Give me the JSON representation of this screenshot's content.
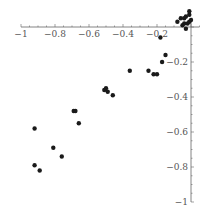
{
  "chart_data": {
    "type": "scatter",
    "title": "",
    "xlabel": "",
    "ylabel": "",
    "xlim": [
      -1,
      0.05
    ],
    "ylim": [
      -1,
      0.05
    ],
    "grid": false,
    "legend": null,
    "x_ticks": [
      {
        "value": -1,
        "label": "−1"
      },
      {
        "value": -0.8,
        "label": "−0.8"
      },
      {
        "value": -0.6,
        "label": "−0.6"
      },
      {
        "value": -0.4,
        "label": "−0.4"
      },
      {
        "value": -0.2,
        "label": "−0.2"
      }
    ],
    "y_ticks": [
      {
        "value": -0.2,
        "label": "−0.2"
      },
      {
        "value": -0.4,
        "label": "−0.4"
      },
      {
        "value": -0.6,
        "label": "−0.6"
      },
      {
        "value": -0.8,
        "label": "−0.8"
      },
      {
        "value": -1,
        "label": "−1"
      }
    ],
    "point_color": "#1a1a1a",
    "axis_color": "#666666",
    "series": [
      {
        "name": "points",
        "x": [
          -0.92,
          -0.92,
          -0.89,
          -0.81,
          -0.76,
          -0.69,
          -0.68,
          -0.66,
          -0.51,
          -0.5,
          -0.49,
          -0.46,
          -0.36,
          -0.25,
          -0.22,
          -0.2,
          -0.17,
          -0.15,
          -0.18,
          -0.08,
          -0.06,
          -0.04,
          -0.03,
          -0.01,
          -0.01,
          -0.05,
          -0.04,
          -0.02,
          -0.01,
          -0.03,
          0.0
        ],
        "y": [
          -0.58,
          -0.79,
          -0.82,
          -0.69,
          -0.74,
          -0.48,
          -0.48,
          -0.55,
          -0.36,
          -0.35,
          -0.37,
          -0.39,
          -0.25,
          -0.25,
          -0.27,
          -0.27,
          -0.2,
          -0.16,
          -0.06,
          0.03,
          0.05,
          0.05,
          0.06,
          0.07,
          0.09,
          0.01,
          0.02,
          0.02,
          0.03,
          -0.01,
          0.04
        ]
      }
    ]
  }
}
